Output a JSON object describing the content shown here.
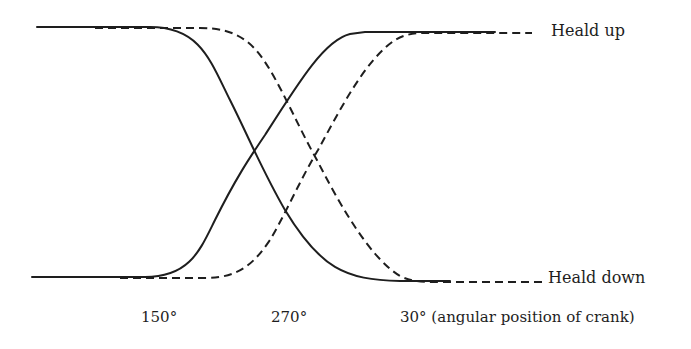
{
  "diagram": {
    "legend": {
      "heald_up": "Heald up",
      "heald_down": "Heald down"
    },
    "axis": {
      "ticks": [
        "150°",
        "270°",
        "30° (angular position of crank)"
      ]
    },
    "colors": {
      "line": "#1e1e1e",
      "background": "#ffffff"
    },
    "curves": [
      {
        "name": "solid-falling",
        "style": "solid",
        "from": "heald up",
        "to": "heald down"
      },
      {
        "name": "solid-rising",
        "style": "solid",
        "from": "heald down",
        "to": "heald up"
      },
      {
        "name": "dashed-falling",
        "style": "dashed",
        "from": "heald up",
        "to": "heald down"
      },
      {
        "name": "dashed-rising",
        "style": "dashed",
        "from": "heald down",
        "to": "heald up"
      }
    ]
  }
}
